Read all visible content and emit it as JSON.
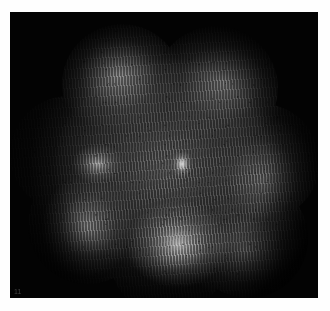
{
  "image": {
    "kind": "micrograph",
    "modality": "interference-contrast micrograph",
    "frame_label": "11",
    "alt_text": "Grayscale interference micrograph of a lobed, cloud-like specimen with fine diagonal fringe striping on a black field",
    "background_color": "#000000",
    "paper_color": "#ffffff",
    "plate": {
      "left": 10,
      "top": 12,
      "width": 308,
      "height": 286
    },
    "features": {
      "lobe_count": 7,
      "fringe_orientation": "near-horizontal, tilted ~6 degrees",
      "central_nucleus": "small bright ovoid near image center",
      "speckles": "scattered dark point inclusions"
    },
    "palette": {
      "field": "#030303",
      "mid_tone": "#808080",
      "highlight": "#ebebeb",
      "shadow": "#0a0a0a",
      "label": "#4a4a4a"
    }
  }
}
